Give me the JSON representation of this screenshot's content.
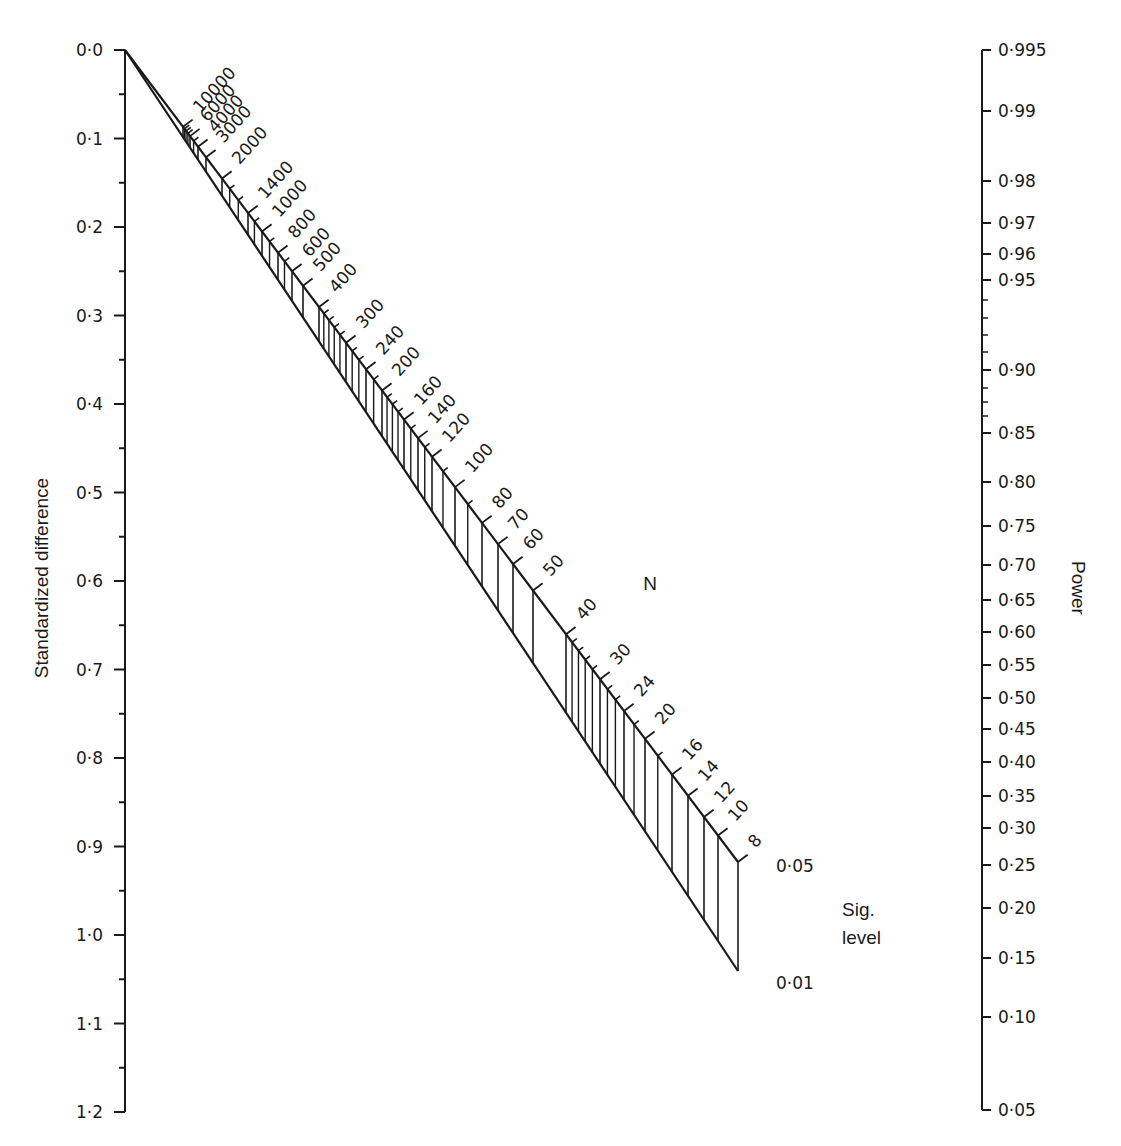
{
  "chart_data": {
    "type": "nomogram",
    "left_axis": {
      "label": "Standardized difference",
      "range": [
        0.0,
        1.2
      ],
      "major_ticks": [
        "0·0",
        "0·1",
        "0·2",
        "0·3",
        "0·4",
        "0·5",
        "0·6",
        "0·7",
        "0·8",
        "0·9",
        "1·0",
        "1·1",
        "1·2"
      ],
      "minor_step": 0.05
    },
    "right_axis": {
      "label": "Power",
      "ticks": [
        "0·995",
        "0·99",
        "0·98",
        "0·97",
        "0·96",
        "0·95",
        "0·90",
        "0·85",
        "0·80",
        "0·75",
        "0·70",
        "0·65",
        "0·60",
        "0·55",
        "0·50",
        "0·45",
        "0·40",
        "0·35",
        "0·30",
        "0·25",
        "0·20",
        "0·15",
        "0·10",
        "0·05"
      ],
      "tick_y": [
        50,
        111,
        181,
        223,
        254,
        280,
        370,
        433,
        482,
        526,
        565,
        600,
        632,
        665,
        698,
        729,
        762,
        796,
        828,
        865,
        908,
        958,
        1017,
        1110
      ]
    },
    "n_scale": {
      "label": "N",
      "labels": [
        10000,
        6000,
        4000,
        3000,
        2000,
        1400,
        1000,
        800,
        600,
        500,
        400,
        300,
        240,
        200,
        160,
        140,
        120,
        100,
        80,
        70,
        60,
        50,
        40,
        30,
        24,
        20,
        16,
        14,
        12,
        10,
        8
      ],
      "anchor_x": {
        "10000": 183,
        "6000": 190,
        "4000": 198,
        "3000": 206,
        "2000": 222,
        "1400": 248,
        "1000": 262,
        "800": 278,
        "600": 292,
        "500": 303,
        "400": 319,
        "300": 346,
        "240": 366,
        "200": 382,
        "160": 404,
        "140": 418,
        "120": 432,
        "100": 455,
        "80": 482,
        "70": 498,
        "60": 513,
        "50": 533,
        "40": 566,
        "30": 600,
        "24": 624,
        "20": 645,
        "16": 672,
        "14": 688,
        "12": 704,
        "10": 718,
        "8": 738
      }
    },
    "sig_level": {
      "label_line1": "Sig.",
      "label_line2": "level",
      "values": [
        "0·05",
        "0·01"
      ]
    },
    "geometry": {
      "apex": [
        125,
        50
      ],
      "upper_end": [
        738,
        862
      ],
      "lower_end": [
        738,
        971
      ]
    }
  }
}
